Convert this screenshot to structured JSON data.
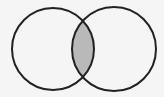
{
  "diagram": {
    "type": "venn",
    "sets": [
      {
        "id": "A",
        "cx": 53,
        "cy": 49,
        "r": 41
      },
      {
        "id": "B",
        "cx": 114,
        "cy": 49,
        "r": 42
      }
    ],
    "highlighted_region": "A∩B",
    "colors": {
      "background": "#f5f5f5",
      "stroke": "#222222",
      "intersection_fill": "#b9b9b9",
      "circle_fill": "#f5f5f5"
    }
  }
}
